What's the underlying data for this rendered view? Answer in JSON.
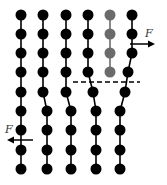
{
  "diagram": {
    "colors": {
      "atom": "#000000",
      "extra_half_plane_atom": "#6b6b6b",
      "bond": "#000000",
      "background": "#ffffff"
    },
    "forces": [
      {
        "label": "F",
        "direction": "right",
        "position": "upper-right"
      },
      {
        "label": "F",
        "direction": "left",
        "position": "lower-left"
      }
    ],
    "slip_plane": {
      "style": "dashed",
      "description": "slip plane"
    },
    "upper_columns": 6,
    "lower_columns": 5,
    "extra_half_plane_column": 5
  }
}
